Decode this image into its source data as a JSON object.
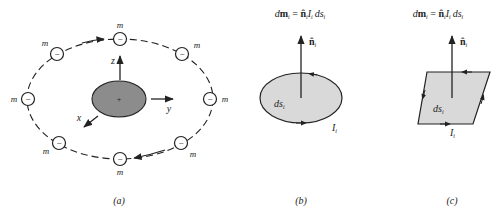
{
  "figure": {
    "panels": [
      {
        "id": "a",
        "caption": "(a)",
        "electron_label": "m",
        "electron_symbol": "−",
        "nucleus_symbol": "+",
        "axes": {
          "x": "x",
          "y": "y",
          "z": "z"
        },
        "electrons": [
          {
            "pos": "top",
            "label": "m"
          },
          {
            "pos": "top-right",
            "label": "m"
          },
          {
            "pos": "right",
            "label": "m"
          },
          {
            "pos": "bottom-right",
            "label": "m"
          },
          {
            "pos": "bottom",
            "label": "m"
          },
          {
            "pos": "bottom-left",
            "label": "m"
          },
          {
            "pos": "left",
            "label": "m"
          },
          {
            "pos": "top-left",
            "label": "m"
          }
        ]
      },
      {
        "id": "b",
        "caption": "(b)",
        "equation": {
          "d": "d",
          "m": "m",
          "sub": "i",
          "eq": " = ",
          "n": "n̂",
          "I": "I",
          "ds": "ds"
        },
        "normal_label": "n̂",
        "normal_sub": "i",
        "area_label": "ds",
        "area_sub": "i",
        "current_label": "I",
        "current_sub": "i",
        "shape": "ellipse"
      },
      {
        "id": "c",
        "caption": "(c)",
        "equation": {
          "d": "d",
          "m": "m",
          "sub": "i",
          "eq": " = ",
          "n": "n̂",
          "I": "I",
          "ds": "ds"
        },
        "normal_label": "n̂",
        "normal_sub": "i",
        "area_label": "ds",
        "area_sub": "i",
        "current_label": "I",
        "current_sub": "i",
        "shape": "parallelogram"
      }
    ],
    "colors": {
      "ink": "#222222",
      "nucleus_fill": "#8c8c8c",
      "loop_fill": "#d9d9d9"
    }
  }
}
